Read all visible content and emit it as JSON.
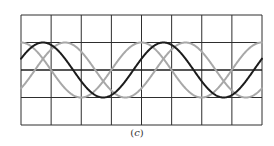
{
  "figure": {
    "caption_open": "(",
    "caption_letter": "c",
    "caption_close": ")"
  },
  "grid": {
    "divisions_x": 8,
    "divisions_y": 4,
    "line_color": "#2e2e2e",
    "center_line_color": "#1e1e1e"
  },
  "waveforms": [
    {
      "name": "reference",
      "color": "#1c1c1c",
      "amplitude_div": 1,
      "period_div": 4,
      "phase_deg": 0
    },
    {
      "name": "leading",
      "color": "#a8a8a8",
      "amplitude_div": 1,
      "period_div": 4,
      "phase_deg": 66
    },
    {
      "name": "lagging",
      "color": "#a8a8a8",
      "amplitude_div": 1,
      "period_div": 4,
      "phase_deg": -66
    }
  ],
  "reference_peak_div": 0.73
}
